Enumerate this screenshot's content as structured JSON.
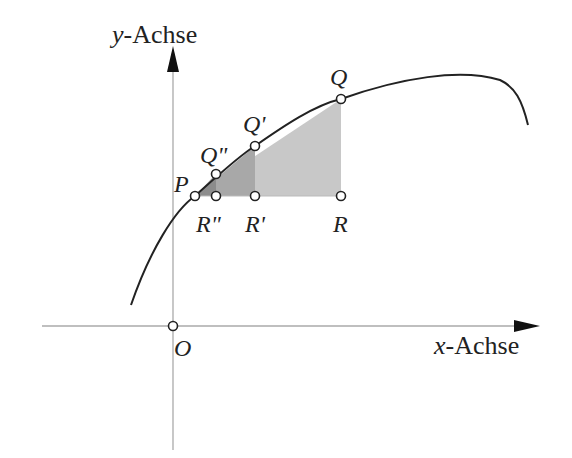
{
  "axes": {
    "x_label_var": "x",
    "x_label_rest": "-Achse",
    "y_label_var": "y",
    "y_label_rest": "-Achse",
    "origin": "O"
  },
  "points": {
    "P": "P",
    "Q": "Q",
    "Q1": "Q'",
    "Q2": "Q\"",
    "R": "R",
    "R1": "R'",
    "R2": "R\""
  },
  "colors": {
    "axis": "#aaaaaa",
    "curve": "#222222",
    "shade_light": "#c8c8c8",
    "shade_dark": "#9a9a9a"
  }
}
